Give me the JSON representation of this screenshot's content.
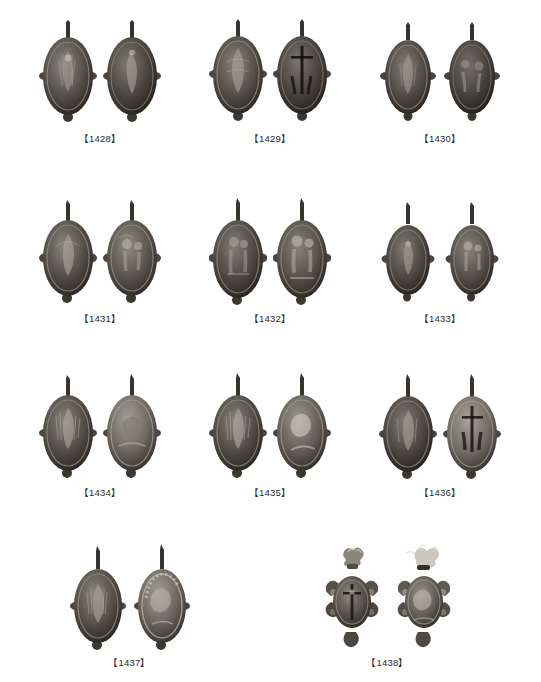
{
  "plate": {
    "background_color": "#fefefe",
    "caption_color": "#2b2b2b",
    "metal_dark": "#2c2a26",
    "metal_mid": "#6b665d",
    "metal_light": "#a9a49a",
    "metal_highlight": "#d6d2c8",
    "rows": [
      {
        "row_index": 1,
        "specimens": [
          {
            "label": "【1428】",
            "id": "1428",
            "shape": "oval",
            "views": [
              "obverse",
              "reverse"
            ]
          },
          {
            "label": "【1429】",
            "id": "1429",
            "shape": "oval",
            "views": [
              "obverse",
              "reverse"
            ]
          },
          {
            "label": "【1430】",
            "id": "1430",
            "shape": "oval",
            "views": [
              "obverse",
              "reverse"
            ]
          }
        ]
      },
      {
        "row_index": 2,
        "specimens": [
          {
            "label": "【1431】",
            "id": "1431",
            "shape": "oval",
            "views": [
              "obverse",
              "reverse"
            ]
          },
          {
            "label": "【1432】",
            "id": "1432",
            "shape": "oval",
            "views": [
              "obverse",
              "reverse"
            ]
          },
          {
            "label": "【1433】",
            "id": "1433",
            "shape": "oval",
            "views": [
              "obverse",
              "reverse"
            ]
          }
        ]
      },
      {
        "row_index": 3,
        "specimens": [
          {
            "label": "【1434】",
            "id": "1434",
            "shape": "oval",
            "views": [
              "obverse",
              "reverse"
            ]
          },
          {
            "label": "【1435】",
            "id": "1435",
            "shape": "oval",
            "views": [
              "obverse",
              "reverse"
            ]
          },
          {
            "label": "【1436】",
            "id": "1436",
            "shape": "oval",
            "views": [
              "obverse",
              "reverse"
            ]
          }
        ]
      },
      {
        "row_index": 4,
        "specimens": [
          {
            "label": "【1437】",
            "id": "1437",
            "shape": "oval",
            "views": [
              "obverse",
              "reverse"
            ]
          },
          {
            "label": "【1438】",
            "id": "1438",
            "shape": "cross",
            "views": [
              "obverse",
              "reverse"
            ]
          }
        ]
      }
    ]
  }
}
